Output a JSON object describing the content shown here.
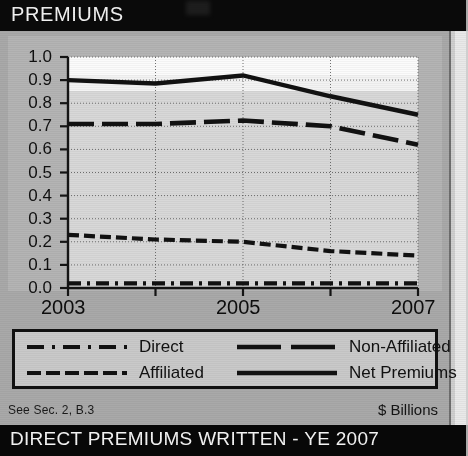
{
  "header": {
    "title": "PREMIUMS"
  },
  "footer": {
    "note": "See Sec. 2, B.3",
    "units": "$ Billions",
    "bar_title": "DIRECT PREMIUMS WRITTEN - YE 2007"
  },
  "legend": {
    "entries": [
      {
        "label": "Direct",
        "style": "dash-dot",
        "swatch": "direct-line-swatch"
      },
      {
        "label": "Non-Affiliated",
        "style": "long-dash",
        "swatch": "non-affiliated-line-swatch"
      },
      {
        "label": "Affiliated",
        "style": "dashed",
        "swatch": "affiliated-line-swatch"
      },
      {
        "label": "Net Premiums",
        "style": "solid",
        "swatch": "net-premiums-line-swatch"
      }
    ]
  },
  "chart_data": {
    "type": "line",
    "title": "PREMIUMS",
    "xlabel": "",
    "ylabel": "",
    "units": "$ Billions",
    "x": [
      2003,
      2004,
      2005,
      2006,
      2007
    ],
    "xtick_labels": [
      "2003",
      "",
      "2005",
      "",
      "2007"
    ],
    "xlim": [
      2003,
      2007
    ],
    "ylim": [
      0.0,
      1.0
    ],
    "ytick_labels": [
      "0.0",
      "0.1",
      "0.2",
      "0.3",
      "0.4",
      "0.5",
      "0.6",
      "0.7",
      "0.8",
      "0.9",
      "1.0"
    ],
    "ytick_values": [
      0.0,
      0.1,
      0.2,
      0.3,
      0.4,
      0.5,
      0.6,
      0.7,
      0.8,
      0.9,
      1.0
    ],
    "grid": true,
    "legend_position": "below-axes",
    "series": [
      {
        "name": "Direct",
        "style": "dash-dot",
        "values": [
          0.02,
          0.02,
          0.02,
          0.02,
          0.02
        ]
      },
      {
        "name": "Affiliated",
        "style": "dashed",
        "values": [
          0.23,
          0.21,
          0.2,
          0.16,
          0.14
        ]
      },
      {
        "name": "Non-Affiliated",
        "style": "long-dash",
        "values": [
          0.71,
          0.71,
          0.725,
          0.7,
          0.62
        ]
      },
      {
        "name": "Net Premiums",
        "style": "solid",
        "values": [
          0.9,
          0.885,
          0.92,
          0.83,
          0.75
        ]
      }
    ]
  },
  "colors": {
    "header_bg": "#0a0a0a",
    "panel_bg": "#a9a9a9",
    "plot_bg": "#d8d8d8",
    "line": "#111111",
    "text_light": "#f2f2f2",
    "text_dark": "#111111"
  }
}
